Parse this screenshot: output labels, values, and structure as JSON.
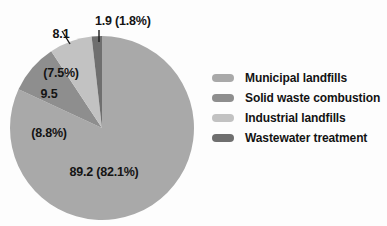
{
  "chart_data": {
    "type": "pie",
    "title": "",
    "xlabel": "",
    "ylabel": "",
    "legend_position": "right",
    "grid": false,
    "categories": [
      "Municipal landfills",
      "Solid waste combustion",
      "Industrial landfills",
      "Wastewater treatment"
    ],
    "values": [
      89.2,
      9.5,
      8.1,
      1.9
    ],
    "percents": [
      82.1,
      8.8,
      7.5,
      1.8
    ],
    "colors": [
      "#a9a9a9",
      "#8e8e8e",
      "#c2c2c2",
      "#6f6f6f"
    ],
    "labels": [
      "89.2 (82.1%)",
      "9.5\n(8.8%)",
      "8.1\n(7.5%)",
      "1.9 (1.8%)"
    ]
  },
  "labels": {
    "municipal": "89.2 (82.1%)",
    "combustion_value": "9.5",
    "combustion_percent": "(8.8%)",
    "industrial_value": "8.1",
    "industrial_percent": "(7.5%)",
    "wastewater": "1.9 (1.8%)"
  },
  "legend": {
    "items": [
      {
        "label": "Municipal landfills",
        "color": "#a9a9a9"
      },
      {
        "label": "Solid waste combustion",
        "color": "#8e8e8e"
      },
      {
        "label": "Industrial landfills",
        "color": "#c2c2c2"
      },
      {
        "label": "Wastewater treatment",
        "color": "#6f6f6f"
      }
    ]
  }
}
